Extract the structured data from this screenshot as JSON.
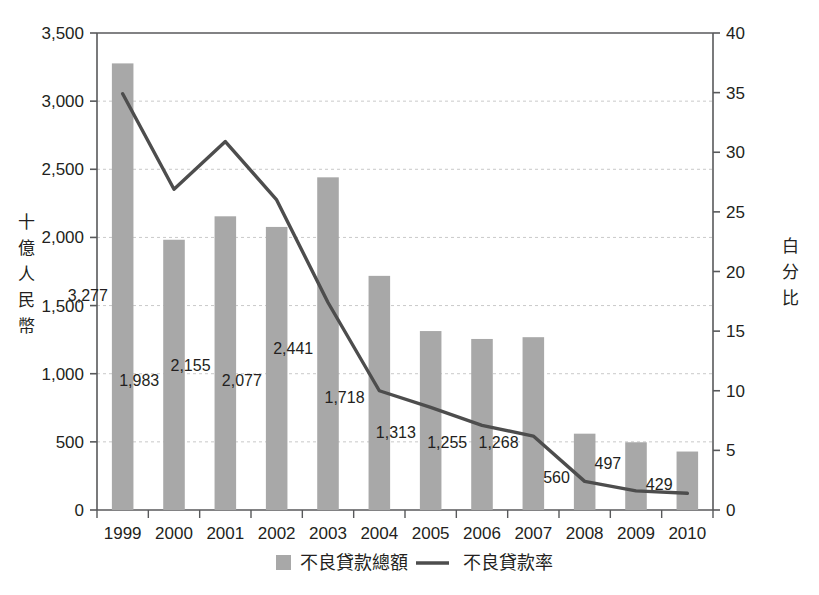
{
  "chart_data": {
    "type": "bar",
    "title": "",
    "subtitle": "",
    "categories": [
      "1999",
      "2000",
      "2001",
      "2002",
      "2003",
      "2004",
      "2005",
      "2006",
      "2007",
      "2008",
      "2009",
      "2010"
    ],
    "series": [
      {
        "name": "不良貸款總額",
        "type": "bar",
        "axis": "left",
        "color": "#a8a8a8",
        "values": [
          3277,
          1983,
          2155,
          2077,
          2441,
          1718,
          1313,
          1255,
          1268,
          560,
          497,
          429
        ],
        "labels": [
          "3,277",
          "1,983",
          "2,155",
          "2,077",
          "2,441",
          "1,718",
          "1,313",
          "1,255",
          "1,268",
          "560",
          "497",
          "429"
        ]
      },
      {
        "name": "不良貸款率",
        "type": "line",
        "axis": "right",
        "color": "#4d4d4d",
        "values": [
          34.9,
          26.9,
          30.9,
          26.0,
          17.4,
          10.0,
          8.6,
          7.1,
          6.2,
          2.4,
          1.6,
          1.4
        ]
      }
    ],
    "xlabel": "",
    "ylabel": "十億人民幣",
    "y2label": "白分比",
    "ylim": [
      0,
      3500
    ],
    "y2lim": [
      0,
      40
    ],
    "yticks": [
      0,
      500,
      1000,
      1500,
      2000,
      2500,
      3000,
      3500
    ],
    "ytick_labels": [
      "0",
      "500",
      "1,000",
      "1,500",
      "2,000",
      "2,500",
      "3,000",
      "3,500"
    ],
    "y2ticks": [
      0,
      5,
      10,
      15,
      20,
      25,
      30,
      35,
      40
    ],
    "y2tick_labels": [
      "0",
      "5",
      "10",
      "15",
      "20",
      "25",
      "30",
      "35",
      "40"
    ],
    "grid": true,
    "grid_axis": "y-left",
    "legend_position": "bottom"
  },
  "axes": {
    "left_title_chars": [
      "十",
      "億",
      "人",
      "民",
      "幣"
    ],
    "right_title_chars": [
      "白",
      "分",
      "比"
    ]
  },
  "legend": {
    "items": [
      {
        "label": "不良貸款總額",
        "marker": "square-swatch",
        "color": "#a8a8a8"
      },
      {
        "label": "不良貸款率",
        "marker": "line-swatch",
        "color": "#4d4d4d"
      }
    ]
  },
  "colors": {
    "background": "#ffffff",
    "bar": "#a8a8a8",
    "line": "#4d4d4d",
    "axis": "#58595b",
    "grid": "#c9c9c9",
    "text": "#231f20"
  }
}
